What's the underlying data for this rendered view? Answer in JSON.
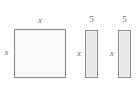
{
  "figure": {
    "type": "algebra-tile-area-model",
    "background_color": "#ffffff",
    "shapes": [
      {
        "name": "square",
        "shape": "square",
        "fill_color": "#fbfbfb",
        "stroke_color": "#8a8a8a",
        "x": 14,
        "y": 29,
        "width": 52,
        "height": 49,
        "labels": [
          {
            "name": "square-top-label",
            "text": "x",
            "position": "top",
            "italic": true
          },
          {
            "name": "square-left-label",
            "text": "x",
            "position": "left",
            "italic": true
          }
        ]
      },
      {
        "name": "rectangle-1",
        "shape": "rectangle",
        "fill_color": "#eaeaea",
        "stroke_color": "#8a8a8a",
        "x": 85,
        "y": 30,
        "width": 13,
        "height": 48,
        "labels": [
          {
            "name": "rectangle-1-top-label",
            "text": "5",
            "position": "top",
            "italic": false
          },
          {
            "name": "rectangle-1-left-label",
            "text": "x",
            "position": "left",
            "italic": true
          }
        ]
      },
      {
        "name": "rectangle-2",
        "shape": "rectangle",
        "fill_color": "#eaeaea",
        "stroke_color": "#8a8a8a",
        "x": 118,
        "y": 30,
        "width": 13,
        "height": 48,
        "labels": [
          {
            "name": "rectangle-2-top-label",
            "text": "5",
            "position": "top",
            "italic": false
          },
          {
            "name": "rectangle-2-left-label",
            "text": "x",
            "position": "left",
            "italic": true
          }
        ]
      }
    ]
  }
}
